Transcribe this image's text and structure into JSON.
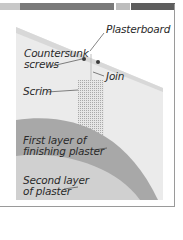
{
  "diagram": {
    "labels": {
      "plasterboard": "Plasterboard",
      "countersunk_line1": "Countersunk",
      "countersunk_line2": "screws",
      "join": "Join",
      "scrim": "Scrim",
      "first_layer_line1": "First layer of",
      "first_layer_line2": "finishing plaster",
      "second_layer_line1": "Second layer",
      "second_layer_line2": "of plaster"
    },
    "colors": {
      "board": "#ececec",
      "board_edge": "#d6d6d6",
      "first_layer": "#a6a6a6",
      "second_layer": "#cfcfcf",
      "scrim": "#bdbdbd",
      "topbar_light": "#c8c8c8",
      "topbar_dark": "#6e6e6e"
    }
  }
}
